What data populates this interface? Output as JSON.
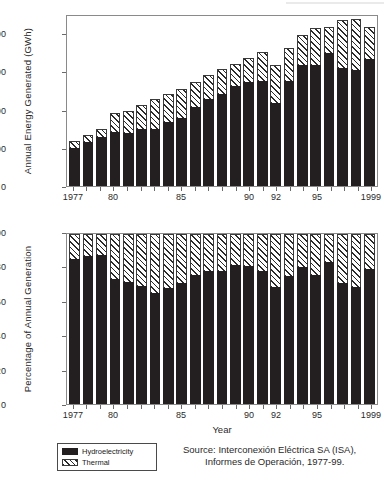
{
  "figure": {
    "legend": {
      "items": [
        {
          "label": "Hydroelectricity",
          "pattern": "solid-black",
          "color": "#231f20"
        },
        {
          "label": "Thermal",
          "pattern": "diagonal-hatch",
          "color": "#2b2b2b"
        }
      ]
    },
    "source_note": {
      "line1": "Source: Interconexión Eléctrica SA (ISA),",
      "line2": "Informes de Operación, 1977-99."
    }
  },
  "chart_data": [
    {
      "type": "bar",
      "id": "annual-energy-generated",
      "stacked": true,
      "title": "",
      "xlabel": "",
      "ylabel": "Annual Energy Generated (GWh)",
      "ylim": [
        0,
        45000
      ],
      "yticks": [
        0,
        10000,
        20000,
        30000,
        40000
      ],
      "ytick_labels": [
        "0",
        "10000",
        "20000",
        "30000",
        "40000"
      ],
      "grid": false,
      "legend_position": "below-figure",
      "categories": [
        1977,
        1978,
        1979,
        1980,
        1981,
        1982,
        1983,
        1984,
        1985,
        1986,
        1987,
        1988,
        1989,
        1990,
        1991,
        1992,
        1993,
        1994,
        1995,
        1996,
        1997,
        1998,
        1999
      ],
      "xtick_labels": [
        "1977",
        "80",
        "85",
        "90",
        "92",
        "95",
        "1999"
      ],
      "xtick_values": [
        1977,
        1980,
        1985,
        1990,
        1992,
        1995,
        1999
      ],
      "series": [
        {
          "name": "Hydroelectricity",
          "values": [
            10000,
            11600,
            12900,
            14200,
            14000,
            14900,
            15000,
            16700,
            17900,
            20800,
            22800,
            24000,
            26200,
            27200,
            27500,
            21800,
            27600,
            31600,
            31600,
            34900,
            31000,
            30300,
            33300
          ]
        },
        {
          "name": "Thermal",
          "values": [
            1800,
            1700,
            2000,
            5000,
            5500,
            6200,
            7800,
            7400,
            7500,
            6400,
            6300,
            6600,
            5800,
            6200,
            7500,
            9900,
            8600,
            7800,
            9700,
            6800,
            12400,
            13500,
            8300
          ]
        }
      ],
      "totals": [
        11800,
        13300,
        14900,
        19200,
        19500,
        21100,
        22800,
        24100,
        25400,
        27200,
        29100,
        30600,
        32000,
        33400,
        35000,
        31700,
        36200,
        39400,
        41300,
        41700,
        43400,
        43800,
        41600
      ]
    },
    {
      "type": "bar",
      "id": "percentage-annual-generation",
      "stacked": true,
      "normalized": true,
      "title": "",
      "xlabel": "Year",
      "ylabel": "Percentage of Annual Generation",
      "ylim": [
        0,
        100
      ],
      "yticks": [
        0,
        20,
        40,
        60,
        80,
        100
      ],
      "ytick_labels": [
        "0",
        "20",
        "40",
        "60",
        "80",
        "100"
      ],
      "grid": false,
      "legend_position": "below-figure",
      "categories": [
        1977,
        1978,
        1979,
        1980,
        1981,
        1982,
        1983,
        1984,
        1985,
        1986,
        1987,
        1988,
        1989,
        1990,
        1991,
        1992,
        1993,
        1994,
        1995,
        1996,
        1997,
        1998,
        1999
      ],
      "xtick_labels": [
        "1977",
        "80",
        "85",
        "90",
        "92",
        "95",
        "1999"
      ],
      "xtick_values": [
        1977,
        1980,
        1985,
        1990,
        1992,
        1995,
        1999
      ],
      "series": [
        {
          "name": "Hydroelectricity",
          "values": [
            85.5,
            87.0,
            87.5,
            73.5,
            72.0,
            69.5,
            65.5,
            68.5,
            71.0,
            76.0,
            78.0,
            78.0,
            82.0,
            81.0,
            78.0,
            69.0,
            75.5,
            80.5,
            76.0,
            83.5,
            71.0,
            69.0,
            79.5
          ]
        },
        {
          "name": "Thermal",
          "values": [
            14.5,
            13.0,
            12.5,
            26.5,
            28.0,
            30.5,
            34.5,
            31.5,
            29.0,
            24.0,
            22.0,
            22.0,
            18.0,
            19.0,
            22.0,
            31.0,
            24.5,
            19.5,
            24.0,
            16.5,
            29.0,
            31.0,
            20.5
          ]
        }
      ]
    }
  ]
}
